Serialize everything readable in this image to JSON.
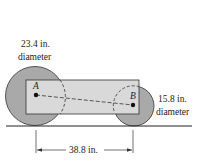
{
  "figure": {
    "large_wheel": {
      "diameter_label": "23.4 in.",
      "diameter_word": "diameter",
      "fill": "#a9a9a9"
    },
    "small_wheel": {
      "diameter_label": "15.8 in.",
      "diameter_word": "diameter",
      "fill": "#a9a9a9"
    },
    "body": {
      "fill": "#d9d9d9"
    },
    "points": {
      "a": "A",
      "b": "B"
    },
    "dimension": {
      "label": "38.8 in."
    }
  }
}
